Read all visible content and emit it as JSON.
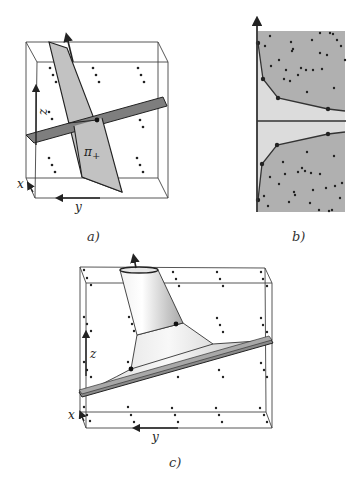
{
  "figure": {
    "panels": [
      {
        "id": "a",
        "caption": "a)",
        "axis_labels": {
          "x": "x",
          "y": "y",
          "z": "z"
        },
        "plane_label": "π",
        "plane_label_sub": "+",
        "colors": {
          "light_plane": "#c2c2c2",
          "dark_plane": "#7e7e7e",
          "box": "#333333"
        }
      },
      {
        "id": "b",
        "caption": "b)",
        "colors": {
          "outer_region": "#b0b0b0",
          "inner_region": "#dcdcdc",
          "axis": "#333333"
        },
        "upper_hull": [
          [
            258,
            43
          ],
          [
            263,
            79
          ],
          [
            278,
            98
          ],
          [
            328,
            109
          ],
          [
            345,
            111
          ]
        ],
        "lower_hull": [
          [
            258,
            200
          ],
          [
            262,
            164
          ],
          [
            277,
            145
          ],
          [
            328,
            134
          ],
          [
            345,
            132
          ]
        ]
      },
      {
        "id": "c",
        "caption": "c)",
        "axis_labels": {
          "x": "x",
          "y": "y",
          "z": "z"
        },
        "colors": {
          "surface": "#d8d8d8",
          "slab": "#8a8a8a",
          "box": "#333333"
        }
      }
    ]
  }
}
